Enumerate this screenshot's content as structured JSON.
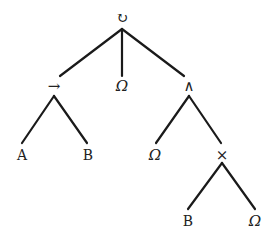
{
  "diagram": {
    "type": "process-tree",
    "nodes": [
      {
        "id": "n0",
        "label": "↻",
        "kind": "operator",
        "name": "loop",
        "x": 122,
        "y": 18
      },
      {
        "id": "n1",
        "label": "→",
        "kind": "operator",
        "name": "sequence",
        "x": 54,
        "y": 86
      },
      {
        "id": "n2",
        "label": "Ω",
        "kind": "leaf",
        "name": "omega",
        "x": 122,
        "y": 86
      },
      {
        "id": "n3",
        "label": "∧",
        "kind": "operator",
        "name": "and",
        "x": 189,
        "y": 86
      },
      {
        "id": "n4",
        "label": "A",
        "kind": "leaf",
        "name": "A",
        "x": 22,
        "y": 155
      },
      {
        "id": "n5",
        "label": "B",
        "kind": "leaf",
        "name": "B",
        "x": 88,
        "y": 155
      },
      {
        "id": "n6",
        "label": "Ω",
        "kind": "leaf",
        "name": "omega",
        "x": 155,
        "y": 155
      },
      {
        "id": "n7",
        "label": "×",
        "kind": "operator",
        "name": "xor",
        "x": 222,
        "y": 155
      },
      {
        "id": "n8",
        "label": "B",
        "kind": "leaf",
        "name": "B",
        "x": 188,
        "y": 221
      },
      {
        "id": "n9",
        "label": "Ω",
        "kind": "leaf",
        "name": "omega",
        "x": 255,
        "y": 221
      }
    ],
    "edges": [
      {
        "from": "n0",
        "to": "n1",
        "x1": 122,
        "y1": 29,
        "x2": 60,
        "y2": 76
      },
      {
        "from": "n0",
        "to": "n2",
        "x1": 122,
        "y1": 29,
        "x2": 122,
        "y2": 76
      },
      {
        "from": "n0",
        "to": "n3",
        "x1": 122,
        "y1": 29,
        "x2": 184,
        "y2": 76
      },
      {
        "from": "n1",
        "to": "n4",
        "x1": 54,
        "y1": 96,
        "x2": 22,
        "y2": 143
      },
      {
        "from": "n1",
        "to": "n5",
        "x1": 54,
        "y1": 96,
        "x2": 87,
        "y2": 143
      },
      {
        "from": "n3",
        "to": "n6",
        "x1": 189,
        "y1": 96,
        "x2": 156,
        "y2": 143
      },
      {
        "from": "n3",
        "to": "n7",
        "x1": 189,
        "y1": 96,
        "x2": 221,
        "y2": 143
      },
      {
        "from": "n7",
        "to": "n8",
        "x1": 222,
        "y1": 163,
        "x2": 188,
        "y2": 209
      },
      {
        "from": "n7",
        "to": "n9",
        "x1": 222,
        "y1": 163,
        "x2": 255,
        "y2": 209
      }
    ]
  }
}
